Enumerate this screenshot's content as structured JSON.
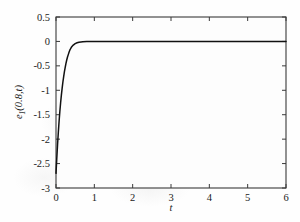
{
  "chart_data": {
    "type": "line",
    "title": "",
    "xlabel": "t",
    "ylabel": "e1(0.8,t)",
    "ylabel_base": "e",
    "ylabel_sub": "1",
    "ylabel_rest": "(0.8,t)",
    "xlim": [
      0,
      6
    ],
    "ylim": [
      -3,
      0.5
    ],
    "xticks": [
      0,
      1,
      2,
      3,
      4,
      5,
      6
    ],
    "xtick_labels": [
      "0",
      "1",
      "2",
      "3",
      "4",
      "5",
      "6"
    ],
    "yticks": [
      0.5,
      0,
      -0.5,
      -1,
      -1.5,
      -2,
      -2.5,
      -3
    ],
    "ytick_labels": [
      "0.5",
      "0",
      "-0.5",
      "-1",
      "-1.5",
      "-2",
      "-2.5",
      "-3"
    ],
    "grid": false,
    "legend": null,
    "series": [
      {
        "name": "e1(0.8,t)",
        "color": "#111111",
        "x": [
          0,
          0.02,
          0.04,
          0.06,
          0.08,
          0.1,
          0.12,
          0.14,
          0.16,
          0.18,
          0.2,
          0.22,
          0.24,
          0.26,
          0.28,
          0.3,
          0.32,
          0.34,
          0.36,
          0.38,
          0.4,
          0.45,
          0.5,
          0.55,
          0.6,
          0.7,
          0.8,
          0.9,
          1.0,
          1.2,
          1.5,
          2.0,
          2.5,
          3.0,
          3.5,
          4.0,
          4.5,
          5.0,
          5.5,
          6.0
        ],
        "y": [
          -2.7,
          -2.4,
          -2.12,
          -1.87,
          -1.64,
          -1.44,
          -1.26,
          -1.1,
          -0.96,
          -0.83,
          -0.72,
          -0.62,
          -0.53,
          -0.45,
          -0.38,
          -0.32,
          -0.27,
          -0.22,
          -0.18,
          -0.15,
          -0.12,
          -0.075,
          -0.045,
          -0.027,
          -0.016,
          -0.006,
          -0.002,
          -0.001,
          0.0,
          0.0,
          0.0,
          0.0,
          0.0,
          0.0,
          0.0,
          0.0,
          0.0,
          0.0,
          0.0,
          0.0
        ]
      }
    ],
    "colors": {
      "curve": "#111111",
      "axis": "#3a3a3a",
      "text": "#1a1a1a",
      "background": "#fefefe"
    },
    "axes_box": {
      "left": 56,
      "right": 286,
      "top": 17,
      "bottom": 188
    }
  }
}
